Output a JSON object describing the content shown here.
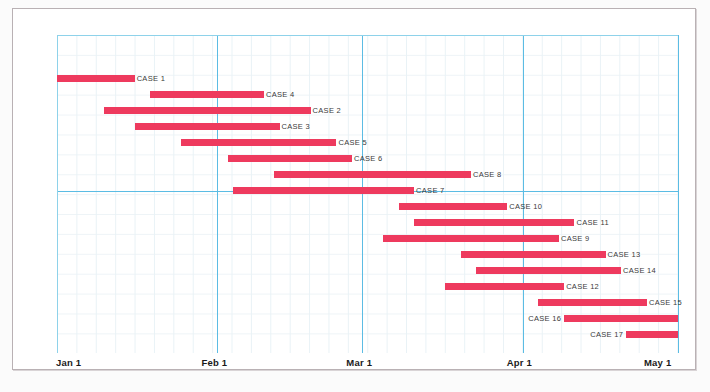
{
  "chart_data": {
    "type": "bar",
    "chart_subtype": "gantt",
    "title": "",
    "xlabel": "",
    "ylabel": "",
    "grid": true,
    "legend": "none",
    "x_axis": {
      "ticks": [
        "Jan 1",
        "Feb 1",
        "Mar 1",
        "Apr 1",
        "May 1"
      ],
      "tick_day_offsets": [
        0,
        31,
        59,
        90,
        120
      ],
      "range_days": [
        0,
        120
      ],
      "major_gridlines": [
        "Jan 1",
        "Feb 1",
        "Mar 1",
        "Apr 1",
        "May 1"
      ],
      "horizontal_major_gridline_after_task": "CASE 7"
    },
    "bar_color": "#ee3a5e",
    "gridline_color": "#5bbce4",
    "minor_gridline_color": "#e9f2f6",
    "frame_color": "#b9b1b4",
    "categories": [
      "CASE 1",
      "CASE 4",
      "CASE 2",
      "CASE 3",
      "CASE 5",
      "CASE 6",
      "CASE 8",
      "CASE 7",
      "CASE 10",
      "CASE 11",
      "CASE 9",
      "CASE 13",
      "CASE 14",
      "CASE 12",
      "CASE 15",
      "CASE 16",
      "CASE 17"
    ],
    "tasks": [
      {
        "label": "CASE 1",
        "start_day": 0,
        "end_day": 15,
        "label_side": "right"
      },
      {
        "label": "CASE 4",
        "start_day": 18,
        "end_day": 40,
        "label_side": "right"
      },
      {
        "label": "CASE 2",
        "start_day": 9,
        "end_day": 49,
        "label_side": "right"
      },
      {
        "label": "CASE 3",
        "start_day": 15,
        "end_day": 43,
        "label_side": "right"
      },
      {
        "label": "CASE 5",
        "start_day": 24,
        "end_day": 54,
        "label_side": "right"
      },
      {
        "label": "CASE 6",
        "start_day": 33,
        "end_day": 57,
        "label_side": "right"
      },
      {
        "label": "CASE 8",
        "start_day": 42,
        "end_day": 80,
        "label_side": "right"
      },
      {
        "label": "CASE 7",
        "start_day": 34,
        "end_day": 69,
        "label_side": "right"
      },
      {
        "label": "CASE 10",
        "start_day": 66,
        "end_day": 87,
        "label_side": "right"
      },
      {
        "label": "CASE 11",
        "start_day": 69,
        "end_day": 100,
        "label_side": "right"
      },
      {
        "label": "CASE 9",
        "start_day": 63,
        "end_day": 97,
        "label_side": "right"
      },
      {
        "label": "CASE 13",
        "start_day": 78,
        "end_day": 106,
        "label_side": "right"
      },
      {
        "label": "CASE 14",
        "start_day": 81,
        "end_day": 109,
        "label_side": "right"
      },
      {
        "label": "CASE 12",
        "start_day": 75,
        "end_day": 98,
        "label_side": "right"
      },
      {
        "label": "CASE 15",
        "start_day": 93,
        "end_day": 114,
        "label_side": "right"
      },
      {
        "label": "CASE 16",
        "start_day": 98,
        "end_day": 120,
        "label_side": "left"
      },
      {
        "label": "CASE 17",
        "start_day": 110,
        "end_day": 120,
        "label_side": "left"
      }
    ]
  },
  "axis": {
    "tick_0": "Jan 1",
    "tick_1": "Feb 1",
    "tick_2": "Mar 1",
    "tick_3": "Apr 1",
    "tick_4": "May 1"
  }
}
